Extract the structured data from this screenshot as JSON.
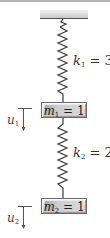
{
  "diagram": {
    "type": "mass-spring system",
    "springs": [
      {
        "name": "k",
        "subscript": "1",
        "equals": " = ",
        "value": "3"
      },
      {
        "name": "k",
        "subscript": "2",
        "equals": " = ",
        "value": "2"
      }
    ],
    "masses": [
      {
        "name": "m",
        "subscript": "1",
        "equals": " = ",
        "value": "1"
      },
      {
        "name": "m",
        "subscript": "2",
        "equals": " = ",
        "value": "1"
      }
    ],
    "displacements": [
      {
        "name": "u",
        "subscript": "1",
        "direction": "down"
      },
      {
        "name": "u",
        "subscript": "2",
        "direction": "down"
      }
    ],
    "colors": {
      "ceiling": "#d4d4d4",
      "spring": "#3a3a3a",
      "mass_fill": "#cfcfcf",
      "arrow": "#555555"
    }
  }
}
